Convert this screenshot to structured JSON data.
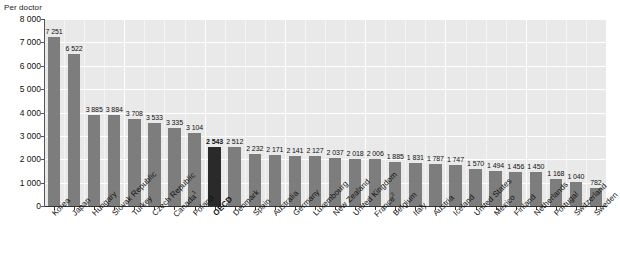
{
  "chart_data": {
    "type": "bar",
    "title": "",
    "subtitle": "",
    "xlabel": "",
    "ylabel": "Per doctor",
    "ylim": [
      0,
      8000
    ],
    "ytick_step": 1000,
    "yticks": [
      "0",
      "1 000",
      "2 000",
      "3 000",
      "4 000",
      "5 000",
      "6 000",
      "7 000",
      "8 000"
    ],
    "grid": true,
    "grid_color": "#ffffff",
    "plot_background": "#e9e9e9",
    "legend": [],
    "bar_color": "#7d7d7d",
    "highlight_color": "#2a2a2a",
    "highlight_category": "OECD",
    "categories": [
      "Korea",
      "Japan",
      "Hungary",
      "Slovak Republic",
      "Turkey",
      "Czech Republic",
      "Canada",
      "Poland",
      "OECD",
      "Denmark",
      "Spain",
      "Australia",
      "Germany",
      "Luxembourg",
      "New Zealand",
      "United Kingdom",
      "France",
      "Belgium",
      "Italy",
      "Austria",
      "Iceland",
      "United States",
      "Mexico",
      "Finland",
      "Netherlands",
      "Portugal",
      "Switzerland",
      "Sweden"
    ],
    "category_footnotes": {
      "Canada": "1",
      "France": "2"
    },
    "values": [
      7251,
      6522,
      3885,
      3884,
      3708,
      3533,
      3335,
      3104,
      2543,
      2512,
      2232,
      2171,
      2141,
      2127,
      2037,
      2018,
      2006,
      1885,
      1831,
      1787,
      1747,
      1570,
      1494,
      1456,
      1450,
      1168,
      1040,
      782
    ],
    "value_labels": [
      "7 251",
      "6 522",
      "3 885",
      "3 884",
      "3 708",
      "3 533",
      "3 335",
      "3 104",
      "2 543",
      "2 512",
      "2 232",
      "2 171",
      "2 141",
      "2 127",
      "2 037",
      "2 018",
      "2 006",
      "1 885",
      "1 831",
      "1 787",
      "1 747",
      "1 570",
      "1 494",
      "1 456",
      "1 450",
      "1 168",
      "1 040",
      "782"
    ]
  }
}
